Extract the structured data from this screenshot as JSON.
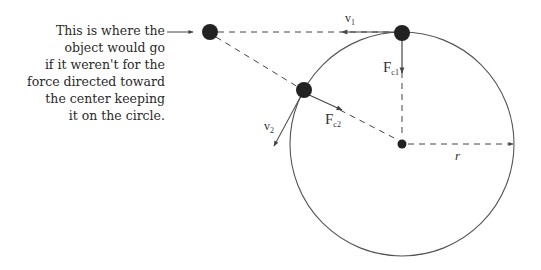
{
  "caption": {
    "lines": [
      "This is where the",
      "object would go",
      "if it weren't for the",
      "force directed toward",
      "the center keeping",
      "it on the circle."
    ]
  },
  "labels": {
    "v1": "v",
    "v1_sub": "1",
    "v2": "v",
    "v2_sub": "2",
    "fc1": "F",
    "fc1_sub": "c1",
    "fc2": "F",
    "fc2_sub": "c2",
    "radius": "r"
  },
  "colors": {
    "ball": "#222222",
    "line": "#444444",
    "circle": "#555555",
    "text": "#2a2a2a"
  }
}
